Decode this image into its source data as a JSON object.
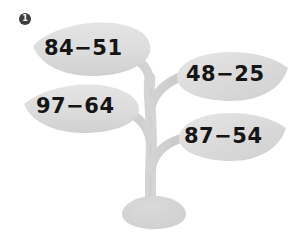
{
  "worksheet": {
    "item_number": "1",
    "background_color": "#ffffff",
    "plant": {
      "leaf_color": "#d9d9d9",
      "leaf_highlight_color": "#e6e6e6",
      "stem_color": "#cfcfcf",
      "pot_color": "#d2d2d2",
      "text_color": "#151515"
    },
    "problems": [
      {
        "position": "top-left",
        "text": "84−51",
        "minuend": 84,
        "subtrahend": 51,
        "operator": "−"
      },
      {
        "position": "middle-right",
        "text": "48−25",
        "minuend": 48,
        "subtrahend": 25,
        "operator": "−"
      },
      {
        "position": "middle-left",
        "text": "97−64",
        "minuend": 97,
        "subtrahend": 64,
        "operator": "−"
      },
      {
        "position": "bottom-right",
        "text": "87−54",
        "minuend": 87,
        "subtrahend": 54,
        "operator": "−"
      }
    ]
  }
}
